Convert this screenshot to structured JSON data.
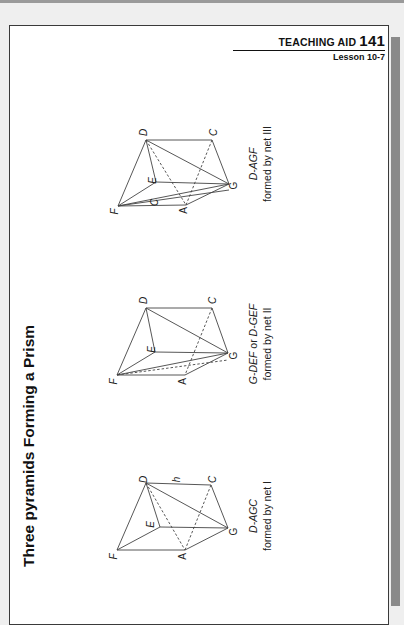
{
  "header": {
    "label": "TEACHING AID",
    "number": "141",
    "lesson": "Lesson 10-7"
  },
  "title": "Three pyramids Forming a Prism",
  "figures": [
    {
      "id": "net-I",
      "caption_name": "D-AGC",
      "caption_desc": "formed by net I",
      "labels": [
        "F",
        "D",
        "h",
        "C",
        "E",
        "A",
        "G"
      ]
    },
    {
      "id": "net-II",
      "caption_name": "G-DEF or D-GEF",
      "caption_name_part1": "G-DEF",
      "caption_or": " or ",
      "caption_name_part2": "D-GEF",
      "caption_desc": "formed by net II",
      "labels": [
        "F",
        "D",
        "C",
        "E",
        "A",
        "G"
      ]
    },
    {
      "id": "net-III",
      "caption_name": "D-AGF",
      "caption_desc": "formed by net III",
      "labels": [
        "F",
        "D",
        "C",
        "E",
        "C",
        "A",
        "G"
      ]
    }
  ]
}
